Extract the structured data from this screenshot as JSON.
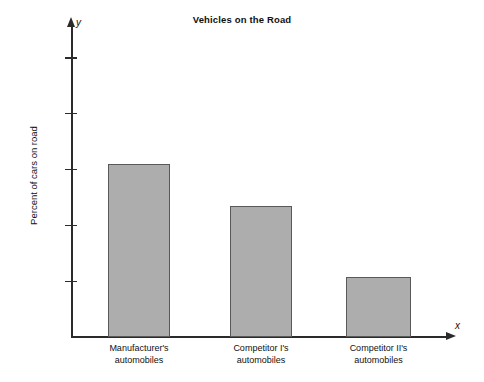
{
  "chart_data": {
    "type": "bar",
    "title": "Vehicles on the Road",
    "xlabel": "",
    "ylabel": "Percent of cars on road",
    "x_axis_symbol": "x",
    "y_axis_symbol": "y",
    "categories": [
      "Manufacturer's automobiles",
      "Competitor I's automobiles",
      "Competitor II's automobiles"
    ],
    "category_lines": [
      [
        "Manufacturer's",
        "automobiles"
      ],
      [
        "Competitor I's",
        "automobiles"
      ],
      [
        "Competitor II's",
        "automobiles"
      ]
    ],
    "values": [
      98.1,
      97.35,
      96.07
    ],
    "ylim": [
      95,
      100
    ],
    "yticks": [
      100,
      99,
      98,
      97,
      96,
      95
    ],
    "ytick_labels": [
      "100",
      "99",
      "98",
      "97",
      "96",
      "95"
    ],
    "grid": false,
    "legend": "none",
    "bar_fill_color": "#adadad",
    "bar_edge_color": "#595959",
    "axis_color": "#2b2b2b",
    "background_color": "#ffffff"
  }
}
